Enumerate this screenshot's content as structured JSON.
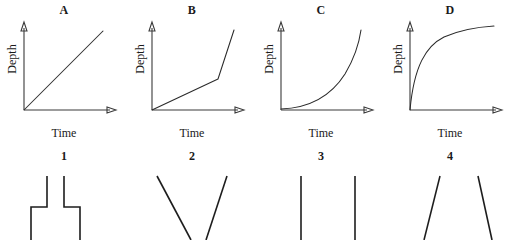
{
  "figure": {
    "kind": "matching-exercise"
  },
  "graphs": [
    {
      "label": "A",
      "xlabel": "Time",
      "ylabel": "Depth",
      "shape": "linear",
      "shape_name": "straight-line-graph"
    },
    {
      "label": "B",
      "xlabel": "Time",
      "ylabel": "Depth",
      "shape": "piecewise-linear",
      "shape_name": "shallow-then-steep-line-graph"
    },
    {
      "label": "C",
      "xlabel": "Time",
      "ylabel": "Depth",
      "shape": "exponential",
      "shape_name": "concave-up-curve-graph"
    },
    {
      "label": "D",
      "xlabel": "Time",
      "ylabel": "Depth",
      "shape": "logarithmic",
      "shape_name": "concave-down-curve-graph"
    }
  ],
  "containers": [
    {
      "label": "1",
      "shape_name": "narrow-neck-flask"
    },
    {
      "label": "2",
      "shape_name": "tapering-funnel-narrow-bottom"
    },
    {
      "label": "3",
      "shape_name": "straight-sided-cylinder"
    },
    {
      "label": "4",
      "shape_name": "flaring-cone-wide-bottom"
    }
  ],
  "colors": {
    "background": "#ffffff",
    "axis": "#3a3a3a",
    "curve": "#2a2a2a",
    "vessel": "#1d1d1d",
    "text": "#1a1a1a"
  }
}
